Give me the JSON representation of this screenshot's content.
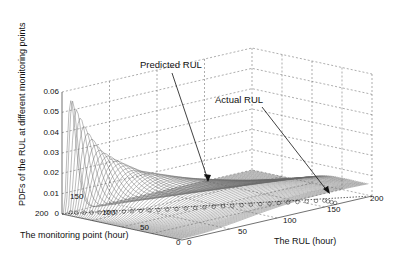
{
  "chart_data": {
    "type": "waterfall-3d",
    "title": "",
    "xlabel": "The RUL (hour)",
    "ylabel": "The monitoring point (hour)",
    "zlabel": "PDFs of the RUL at different monitoring points",
    "x_ticks": [
      "0",
      "50",
      "100",
      "150",
      "200"
    ],
    "y_ticks": [
      "0",
      "50",
      "100",
      "150",
      "200"
    ],
    "z_ticks": [
      "0",
      "0.01",
      "0.02",
      "0.03",
      "0.04",
      "0.05",
      "0.06"
    ],
    "xlim": [
      0,
      200
    ],
    "ylim": [
      0,
      200
    ],
    "zlim": [
      0,
      0.06
    ],
    "grid": true,
    "annotations": [
      {
        "text": "Predicted RUL",
        "points_to": "predicted RUL trajectory (circle markers)"
      },
      {
        "text": "Actual RUL",
        "points_to": "actual RUL line"
      }
    ],
    "series_description": "Family of RUL probability density curves, one per monitoring point; peak density increases as the monitoring point approaches end of life",
    "peaks": [
      {
        "monitoring_point": 195,
        "peak_pdf": 0.055,
        "peak_rul": 8
      },
      {
        "monitoring_point": 185,
        "peak_pdf": 0.041,
        "peak_rul": 15
      },
      {
        "monitoring_point": 175,
        "peak_pdf": 0.031,
        "peak_rul": 22
      },
      {
        "monitoring_point": 165,
        "peak_pdf": 0.026,
        "peak_rul": 30
      },
      {
        "monitoring_point": 150,
        "peak_pdf": 0.02,
        "peak_rul": 42
      },
      {
        "monitoring_point": 125,
        "peak_pdf": 0.015,
        "peak_rul": 65
      },
      {
        "monitoring_point": 100,
        "peak_pdf": 0.011,
        "peak_rul": 90
      },
      {
        "monitoring_point": 75,
        "peak_pdf": 0.009,
        "peak_rul": 115
      },
      {
        "monitoring_point": 50,
        "peak_pdf": 0.007,
        "peak_rul": 140
      },
      {
        "monitoring_point": 25,
        "peak_pdf": 0.006,
        "peak_rul": 165
      }
    ]
  }
}
